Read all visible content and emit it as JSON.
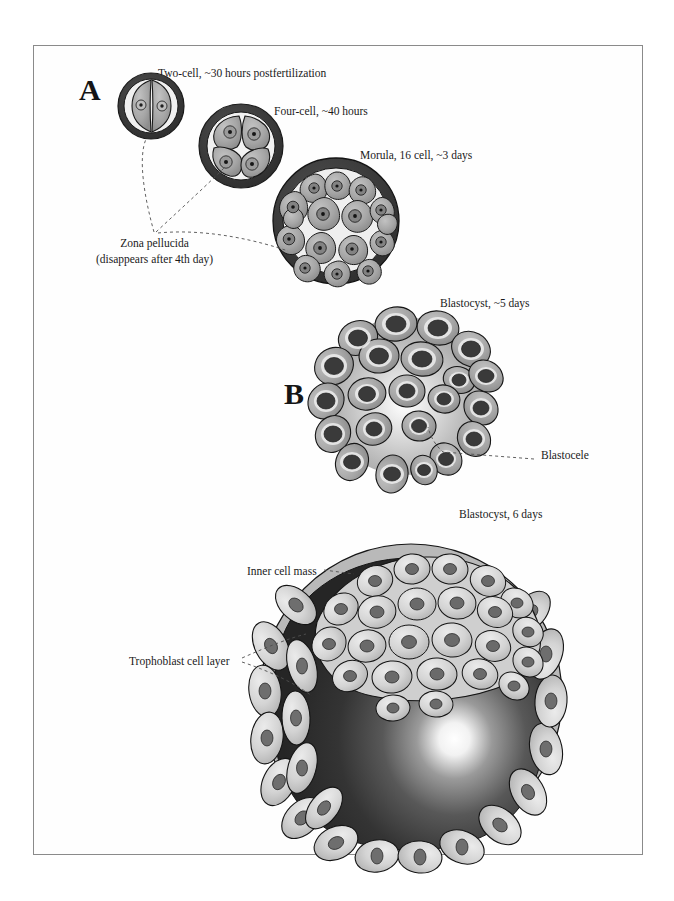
{
  "figure": {
    "border_color": "#8a8a8a",
    "background": "#ffffff"
  },
  "panels": [
    {
      "id": "A",
      "letter": "A",
      "x": 78,
      "y": 74
    },
    {
      "id": "B",
      "letter": "B",
      "x": 283,
      "y": 378
    },
    {
      "id": "C",
      "letter": "C",
      "x": 268,
      "y": 672
    }
  ],
  "labels": {
    "two_cell": "Two-cell, ~30 hours postfertilization",
    "four_cell": "Four-cell, ~40 hours",
    "morula": "Morula, 16 cell, ~3 days",
    "zona_line1": "Zona pellucida",
    "zona_line2": "(disappears after 4th day)",
    "blastocyst_5": "Blastocyst, ~5 days",
    "blastocele": "Blastocele",
    "blastocyst_6": "Blastocyst, 6 days",
    "inner_cell_mass": "Inner cell mass",
    "trophoblast": "Trophoblast cell layer"
  },
  "colors": {
    "zona_dark": "#3a3a3a",
    "cytoplasm": "#a8a8a8",
    "cytoplasm_light": "#d8d8d8",
    "nucleus": "#4a4a4a",
    "nucleus_dark": "#333333",
    "halo": "#e8e8e8",
    "cavity_dark": "#2b2b2b",
    "cavity_light": "#ffffff",
    "outline": "#111111",
    "leader": "#555555"
  },
  "stages": {
    "two_cell": {
      "cells": 2,
      "cx": 150,
      "cy": 105,
      "r": 33
    },
    "four_cell": {
      "cells": 4,
      "cx": 240,
      "cy": 145,
      "r": 42
    },
    "morula": {
      "cells": 16,
      "cx": 335,
      "cy": 220,
      "r": 63
    },
    "blastocyst_early": {
      "cx": 400,
      "cy": 395,
      "r": 82
    },
    "blastocyst_late": {
      "cx": 410,
      "cy": 690,
      "r": 150
    }
  }
}
